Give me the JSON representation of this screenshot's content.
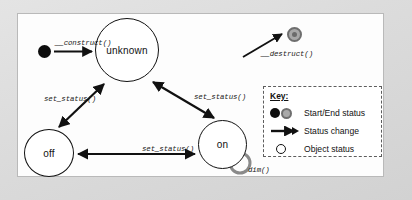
{
  "diagram": {
    "type": "state-diagram",
    "title": "",
    "nodes": [
      {
        "id": "start",
        "label": "",
        "shape": "filled-dot",
        "role": "start-status"
      },
      {
        "id": "unknown",
        "label": "unknown",
        "shape": "circle",
        "role": "object-status"
      },
      {
        "id": "off",
        "label": "off",
        "shape": "circle",
        "role": "object-status"
      },
      {
        "id": "on",
        "label": "on",
        "shape": "circle",
        "role": "object-status"
      },
      {
        "id": "end",
        "label": "",
        "shape": "ring",
        "role": "end-status"
      }
    ],
    "edges": [
      {
        "from": "start",
        "to": "unknown",
        "label": "__construct()",
        "direction": "forward"
      },
      {
        "from": "unknown",
        "to": "end",
        "label": "__destruct()",
        "direction": "forward"
      },
      {
        "from": "off",
        "to": "unknown",
        "label": "set_status()",
        "direction": "both"
      },
      {
        "from": "on",
        "to": "unknown",
        "label": "set_status()",
        "direction": "both"
      },
      {
        "from": "off",
        "to": "on",
        "label": "set_status()",
        "direction": "both"
      },
      {
        "from": "on",
        "to": "on",
        "label": "dim()",
        "direction": "self-loop"
      }
    ]
  },
  "legend": {
    "title": "Key:",
    "items": [
      {
        "symbol": "filled-dot-and-ring",
        "label": "Start/End status"
      },
      {
        "symbol": "arrow",
        "label": "Status change"
      },
      {
        "symbol": "hollow-circle",
        "label": "Object status"
      }
    ]
  },
  "colors": {
    "page_background": "#d9d9d9",
    "panel_background": "#fdfdfd",
    "stroke": "#111111",
    "end_status": "#a8a8a8",
    "self_loop": "#8a8a8a"
  }
}
